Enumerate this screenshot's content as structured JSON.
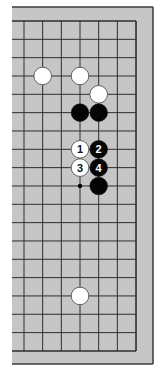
{
  "diagram": {
    "type": "go-board-fragment",
    "visible_columns": 7,
    "visible_rows": 19,
    "edges_shown": [
      "top",
      "right",
      "bottom"
    ],
    "colors": {
      "board": "#c6c6c6",
      "board_border": "#3a3a3a",
      "grid_line": "#2e2e2e",
      "black_stone": "#050505",
      "white_stone": "#ffffff",
      "white_stone_outline": "#555555",
      "black_label": "#ffffff",
      "white_label": "#111111"
    },
    "stones": [
      {
        "color": "white",
        "col": 1,
        "row": 3,
        "label": ""
      },
      {
        "color": "white",
        "col": 3,
        "row": 3,
        "label": ""
      },
      {
        "color": "white",
        "col": 4,
        "row": 4,
        "label": ""
      },
      {
        "color": "black",
        "col": 3,
        "row": 5,
        "label": ""
      },
      {
        "color": "black",
        "col": 4,
        "row": 5,
        "label": ""
      },
      {
        "color": "white",
        "col": 3,
        "row": 7,
        "label": "1"
      },
      {
        "color": "black",
        "col": 4,
        "row": 7,
        "label": "2"
      },
      {
        "color": "white",
        "col": 3,
        "row": 8,
        "label": "3"
      },
      {
        "color": "black",
        "col": 4,
        "row": 8,
        "label": "4"
      },
      {
        "color": "black",
        "col": 4,
        "row": 9,
        "label": ""
      },
      {
        "color": "white",
        "col": 3,
        "row": 15,
        "label": ""
      }
    ],
    "markers": [
      {
        "type": "dot",
        "col": 3,
        "row": 9
      }
    ]
  }
}
